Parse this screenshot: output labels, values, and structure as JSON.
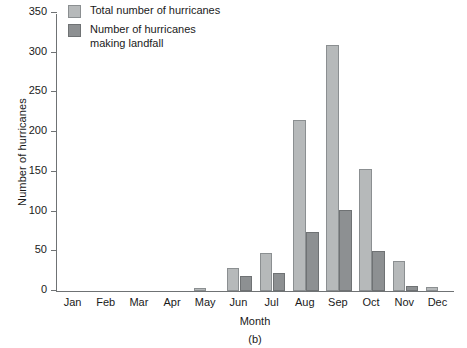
{
  "chart_data": {
    "type": "bar",
    "title": "",
    "caption": "(b)",
    "xlabel": "Month",
    "ylabel": "Number of hurricanes",
    "categories": [
      "Jan",
      "Feb",
      "Mar",
      "Apr",
      "May",
      "Jun",
      "Jul",
      "Aug",
      "Sep",
      "Oct",
      "Nov",
      "Dec"
    ],
    "series": [
      {
        "name": "Total number of hurricanes",
        "color": "#b6b9ba",
        "values": [
          0,
          0,
          0,
          0,
          4,
          29,
          48,
          215,
          310,
          154,
          38,
          5
        ]
      },
      {
        "name": "Number of hurricanes\nmaking landfall",
        "color": "#8d9092",
        "values": [
          0,
          0,
          0,
          0,
          0,
          19,
          23,
          74,
          102,
          50,
          6,
          0
        ]
      }
    ],
    "ylim": [
      0,
      350
    ],
    "yticks": [
      0,
      50,
      100,
      150,
      200,
      250,
      300,
      350
    ],
    "ytick_labels": [
      "0",
      "50",
      "100",
      "150",
      "200",
      "250",
      "300",
      "350"
    ],
    "grid": false,
    "legend_position": "top-left"
  },
  "legend": {
    "items": [
      {
        "label": "Total number of hurricanes",
        "swatch": "total"
      },
      {
        "label": "Number of hurricanes\nmaking landfall",
        "swatch": "landfall"
      }
    ]
  }
}
